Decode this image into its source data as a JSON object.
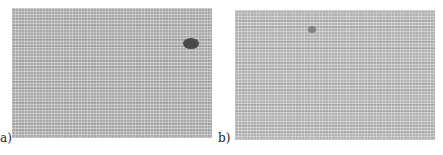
{
  "figure": {
    "panels": [
      {
        "id": "a",
        "label": "a)",
        "description": "Grey grid-textured image with a dark oval spot in the upper right"
      },
      {
        "id": "b",
        "label": "b)",
        "description": "Grey grid-textured image with a faint small speckle near the top center"
      }
    ]
  }
}
